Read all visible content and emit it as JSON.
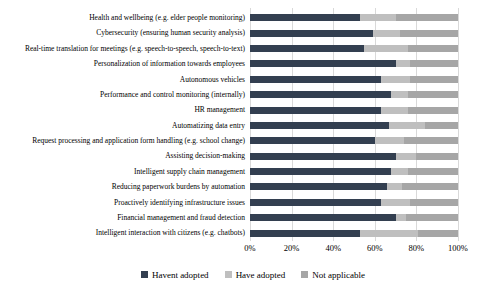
{
  "chart_data": {
    "type": "bar",
    "orientation": "horizontal",
    "stacked": true,
    "title": "",
    "xlabel": "",
    "ylabel": "",
    "xlim": [
      0,
      100
    ],
    "x_ticks": [
      "0%",
      "20%",
      "40%",
      "60%",
      "80%",
      "100%"
    ],
    "grid": "vertical",
    "gridline_color": "#d9d9d9",
    "background_color": "#ffffff",
    "legend_position": "bottom",
    "categories": [
      "Health and wellbeing (e.g. elder people monitoring)",
      "Cybersecurity (ensuring human security analysis)",
      "Real-time translation for meetings (e.g. speech-to-speech, speech-to-text)",
      "Personalization of information towards employees",
      "Autonomous vehicles",
      "Performance and control monitoring (internally)",
      "HR management",
      "Automatizing data entry",
      "Request processing and application form handling (e.g. school change)",
      "Assisting decision-making",
      "Intelligent supply chain management",
      "Reducing paperwork burdens by automation",
      "Proactively identifying infrastructure issues",
      "Financial management and fraud detection",
      "Intelligent interaction with citizens (e.g. chatbots)"
    ],
    "series": [
      {
        "name": "Havent adopted",
        "color": "#333f50",
        "values": [
          53,
          59,
          55,
          70,
          63,
          68,
          63,
          67,
          60,
          70,
          68,
          66,
          63,
          70,
          53
        ]
      },
      {
        "name": "Have adopted",
        "color": "#bfbfbf",
        "values": [
          17,
          13,
          21,
          7,
          14,
          8,
          13,
          17,
          14,
          10,
          8,
          7,
          14,
          5,
          28
        ]
      },
      {
        "name": "Not applicable",
        "color": "#a6a6a6",
        "values": [
          30,
          28,
          24,
          23,
          23,
          24,
          24,
          16,
          26,
          20,
          24,
          27,
          23,
          25,
          19
        ]
      }
    ]
  }
}
